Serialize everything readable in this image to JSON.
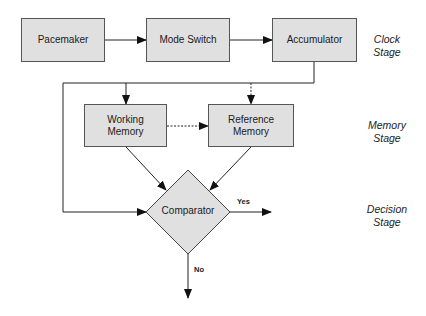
{
  "diagram": {
    "nodes": {
      "pacemaker": "Pacemaker",
      "mode_switch": "Mode Switch",
      "accumulator": "Accumulator",
      "working_memory_line1": "Working",
      "working_memory_line2": "Memory",
      "reference_memory_line1": "Reference",
      "reference_memory_line2": "Memory",
      "comparator": "Comparator"
    },
    "stages": {
      "clock": [
        "Clock",
        "Stage"
      ],
      "memory": [
        "Memory",
        "Stage"
      ],
      "decision": [
        "Decision",
        "Stage"
      ]
    },
    "edge_labels": {
      "yes": "Yes",
      "no": "No"
    },
    "edges": [
      {
        "from": "Pacemaker",
        "to": "Mode Switch",
        "style": "solid"
      },
      {
        "from": "Mode Switch",
        "to": "Accumulator",
        "style": "solid"
      },
      {
        "from": "Accumulator",
        "to": "Working Memory",
        "style": "solid"
      },
      {
        "from": "Accumulator",
        "to": "Reference Memory",
        "style": "dashed"
      },
      {
        "from": "Accumulator",
        "to": "Comparator",
        "style": "solid"
      },
      {
        "from": "Working Memory",
        "to": "Reference Memory",
        "style": "dashed"
      },
      {
        "from": "Working Memory",
        "to": "Comparator",
        "style": "solid"
      },
      {
        "from": "Reference Memory",
        "to": "Comparator",
        "style": "solid"
      },
      {
        "from": "Comparator",
        "to": "out",
        "label": "Yes",
        "style": "solid"
      },
      {
        "from": "Comparator",
        "to": "out",
        "label": "No",
        "style": "solid"
      }
    ],
    "colors": {
      "box_fill": "#e0e0e0",
      "stroke": "#333333"
    }
  }
}
